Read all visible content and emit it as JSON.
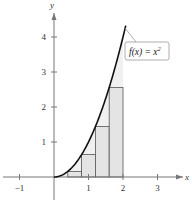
{
  "chart_data": {
    "type": "bar",
    "subtype": "riemann-sum-right-endpoints",
    "title": "",
    "function": {
      "label": "f(x) = x²",
      "label_parts": {
        "base": "f(x) = x",
        "exp": "2"
      },
      "expression": "x^2",
      "domain": [
        0,
        2.08
      ]
    },
    "rectangles": [
      {
        "x0": 0.0,
        "x1": 0.4,
        "height": 0.0
      },
      {
        "x0": 0.4,
        "x1": 0.8,
        "height": 0.16
      },
      {
        "x0": 0.8,
        "x1": 1.2,
        "height": 0.64
      },
      {
        "x0": 1.2,
        "x1": 1.6,
        "height": 1.44
      },
      {
        "x0": 1.6,
        "x1": 2.0,
        "height": 2.56
      }
    ],
    "categories": [
      "[0,0.4]",
      "[0.4,0.8]",
      "[0.8,1.2]",
      "[1.2,1.6]",
      "[1.6,2.0]"
    ],
    "values": [
      0,
      0.16,
      0.64,
      1.44,
      2.56
    ],
    "xlabel": "x",
    "ylabel": "y",
    "xlim": [
      -1.5,
      3.7
    ],
    "ylim": [
      0,
      4.6
    ],
    "xticks": [
      -1,
      1,
      2,
      3
    ],
    "xtick_labels": [
      "−1",
      "1",
      "2",
      "3"
    ],
    "yticks": [
      1,
      2,
      3,
      4
    ],
    "ytick_labels": [
      "1",
      "2",
      "3",
      "4"
    ],
    "grid": false,
    "legend": "callout box near upper-right of curve",
    "colors": {
      "curve": "#111111",
      "rect_fill": "#e4e4e4",
      "rect_stroke": "#555555",
      "axis": "#777777",
      "callout_stroke": "#999999"
    }
  }
}
